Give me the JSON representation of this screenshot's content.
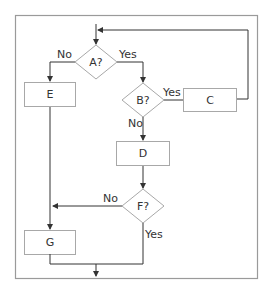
{
  "diagram": {
    "type": "flowchart",
    "colors": {
      "frame": "#9a9a9a",
      "node_stroke": "#a8a8a8",
      "edge": "#333333",
      "text": "#333333",
      "background": "#ffffff"
    },
    "nodes": {
      "A": {
        "label": "A?",
        "shape": "diamond"
      },
      "B": {
        "label": "B?",
        "shape": "diamond"
      },
      "C": {
        "label": "C",
        "shape": "rectangle"
      },
      "D": {
        "label": "D",
        "shape": "rectangle"
      },
      "E": {
        "label": "E",
        "shape": "rectangle"
      },
      "F": {
        "label": "F?",
        "shape": "diamond"
      },
      "G": {
        "label": "G",
        "shape": "rectangle"
      }
    },
    "edge_labels": {
      "a_no": "No",
      "a_yes": "Yes",
      "b_yes": "Yes",
      "b_no": "No",
      "f_no": "No",
      "f_yes": "Yes"
    },
    "edges": [
      {
        "from": "start",
        "to": "A"
      },
      {
        "from": "A",
        "to": "E",
        "label": "No"
      },
      {
        "from": "A",
        "to": "B",
        "label": "Yes"
      },
      {
        "from": "B",
        "to": "C",
        "label": "Yes"
      },
      {
        "from": "B",
        "to": "D",
        "label": "No"
      },
      {
        "from": "C",
        "to": "A",
        "label": ""
      },
      {
        "from": "D",
        "to": "F"
      },
      {
        "from": "F",
        "to": "G",
        "label": "No"
      },
      {
        "from": "E",
        "to": "G"
      },
      {
        "from": "F",
        "to": "end",
        "label": "Yes"
      },
      {
        "from": "G",
        "to": "end"
      }
    ]
  }
}
